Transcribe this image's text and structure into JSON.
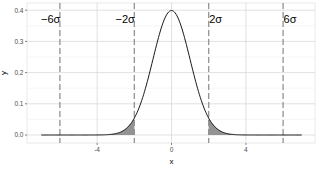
{
  "chart_data": {
    "type": "line",
    "title": "",
    "xlabel": "x",
    "ylabel": "y",
    "xlim": [
      -7.7,
      7.8
    ],
    "ylim": [
      -0.02,
      0.42
    ],
    "grid": true,
    "legend": null,
    "x_ticks": [
      -4,
      0,
      4
    ],
    "x_tick_labels": [
      "-4",
      "0",
      "4"
    ],
    "y_ticks": [
      0.0,
      0.1,
      0.2,
      0.3,
      0.4
    ],
    "y_tick_labels": [
      "0.0",
      "0.1",
      "0.2",
      "0.3",
      "0.4"
    ],
    "series": [
      {
        "name": "standard normal density",
        "function": "dnorm(x, 0, 1)",
        "x_range": [
          -7,
          7
        ],
        "color": "#000000"
      }
    ],
    "shaded_regions": [
      {
        "from": -3.2,
        "to": -2,
        "color": "#808080"
      },
      {
        "from": 2,
        "to": 3.2,
        "color": "#808080"
      }
    ],
    "vertical_lines": [
      {
        "x": -6,
        "label": "−6σ",
        "style": "dashed"
      },
      {
        "x": -2,
        "label": "−2σ",
        "style": "dashed"
      },
      {
        "x": 2,
        "label": "2σ",
        "style": "dashed"
      },
      {
        "x": 6,
        "label": "6σ",
        "style": "dashed"
      }
    ],
    "colors": {
      "panel_background": "#ffffff",
      "grid_major": "#d4d4d4",
      "grid_minor": "#ececec",
      "vline": "#8c8c8c",
      "curve": "#000000",
      "shade": "#808080"
    }
  }
}
